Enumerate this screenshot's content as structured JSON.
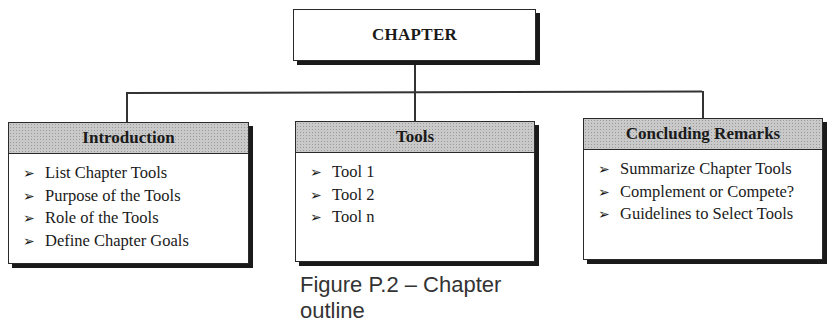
{
  "diagram": {
    "root": {
      "label": "CHAPTER"
    },
    "sections": [
      {
        "title": "Introduction",
        "items": [
          "List Chapter Tools",
          "Purpose of the Tools",
          "Role of the Tools",
          "Define Chapter Goals"
        ]
      },
      {
        "title": "Tools",
        "items": [
          "Tool 1",
          "Tool 2",
          "Tool n"
        ]
      },
      {
        "title": "Concluding Remarks",
        "items": [
          "Summarize Chapter Tools",
          "Complement or Compete?",
          "Guidelines to Select Tools"
        ]
      }
    ],
    "bullet_glyph": "➢",
    "caption": "Figure P.2 – Chapter outline"
  },
  "colors": {
    "header_fill": "#c9c9c9",
    "border": "#2a2a2a",
    "shadow": "#1a1a1a"
  }
}
